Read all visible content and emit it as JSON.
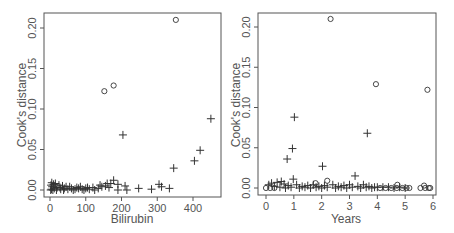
{
  "chart_data": [
    {
      "type": "scatter",
      "title": "",
      "xlabel": "Bilirubin",
      "ylabel": "Cook's distance",
      "xlim": [
        -10,
        470
      ],
      "ylim": [
        -0.008,
        0.22
      ],
      "xticks": [
        "0",
        "100",
        "200",
        "300",
        "400"
      ],
      "yticks": [
        "0.00",
        "0.05",
        "0.10",
        "0.15",
        "0.20"
      ],
      "grid": false,
      "legend": null,
      "series": [
        {
          "name": "circle-points",
          "marker": "o",
          "points": [
            [
              152,
              0.122
            ],
            [
              178,
              0.129
            ],
            [
              352,
              0.21
            ]
          ]
        },
        {
          "name": "plus-points",
          "marker": "+",
          "points": [
            [
              204,
              0.068
            ],
            [
              450,
              0.088
            ],
            [
              420,
              0.049
            ],
            [
              404,
              0.036
            ],
            [
              346,
              0.027
            ],
            [
              178,
              0.012
            ],
            [
              170,
              0.008
            ],
            [
              160,
              0.008
            ],
            [
              190,
              0.007
            ],
            [
              210,
              0.005
            ],
            [
              305,
              0.007
            ],
            [
              312,
              0.004
            ],
            [
              334,
              0.002
            ],
            [
              248,
              0.002
            ],
            [
              284,
              0.001
            ],
            [
              215,
              0.0
            ],
            [
              190,
              0.0
            ],
            [
              165,
              0.003
            ],
            [
              145,
              0.004
            ],
            [
              135,
              0.002
            ],
            [
              120,
              0.003
            ],
            [
              110,
              0.001
            ],
            [
              100,
              0.002
            ],
            [
              90,
              0.001
            ],
            [
              80,
              0.002
            ],
            [
              70,
              0.001
            ],
            [
              60,
              0.002
            ],
            [
              50,
              0.001
            ],
            [
              45,
              0.004
            ],
            [
              40,
              0.002
            ],
            [
              35,
              0.005
            ],
            [
              30,
              0.001
            ],
            [
              25,
              0.006
            ],
            [
              20,
              0.003
            ],
            [
              15,
              0.008
            ],
            [
              12,
              0.002
            ],
            [
              10,
              0.007
            ],
            [
              8,
              0.0
            ],
            [
              6,
              0.004
            ],
            [
              5,
              0.009
            ],
            [
              4,
              0.001
            ],
            [
              3,
              0.006
            ],
            [
              2,
              0.0
            ],
            [
              18,
              0.0
            ],
            [
              28,
              0.003
            ],
            [
              38,
              0.0
            ],
            [
              55,
              0.004
            ],
            [
              65,
              0.0
            ],
            [
              75,
              0.003
            ],
            [
              85,
              0.004
            ],
            [
              95,
              0.0
            ],
            [
              105,
              0.003
            ],
            [
              125,
              0.0
            ],
            [
              140,
              0.006
            ],
            [
              155,
              0.005
            ]
          ]
        }
      ]
    },
    {
      "type": "scatter",
      "title": "",
      "xlabel": "Years",
      "ylabel": "Cook's distance",
      "xlim": [
        -0.2,
        6.2
      ],
      "ylim": [
        -0.008,
        0.22
      ],
      "xticks": [
        "0",
        "1",
        "2",
        "3",
        "4",
        "5",
        "6"
      ],
      "yticks": [
        "0.00",
        "0.05",
        "0.10",
        "0.15",
        "0.20"
      ],
      "grid": false,
      "legend": null,
      "series": [
        {
          "name": "circle-points",
          "marker": "o",
          "points": [
            [
              2.32,
              0.21
            ],
            [
              3.95,
              0.129
            ],
            [
              5.8,
              0.122
            ],
            [
              2.2,
              0.009
            ],
            [
              1.78,
              0.006
            ],
            [
              4.72,
              0.004
            ],
            [
              5.68,
              0.003
            ],
            [
              0.0,
              0.0
            ],
            [
              0.15,
              0.0
            ],
            [
              0.3,
              0.0
            ],
            [
              4.1,
              0.0
            ],
            [
              4.3,
              0.0
            ],
            [
              4.5,
              0.0
            ],
            [
              4.7,
              0.0
            ],
            [
              4.9,
              0.0
            ],
            [
              5.05,
              0.0
            ],
            [
              5.15,
              0.0
            ],
            [
              5.55,
              0.0
            ],
            [
              5.72,
              0.0
            ],
            [
              5.85,
              0.0
            ],
            [
              5.9,
              0.0
            ]
          ]
        },
        {
          "name": "plus-points",
          "marker": "+",
          "points": [
            [
              1.02,
              0.088
            ],
            [
              3.64,
              0.068
            ],
            [
              0.95,
              0.049
            ],
            [
              0.76,
              0.036
            ],
            [
              2.03,
              0.027
            ],
            [
              3.2,
              0.015
            ],
            [
              0.98,
              0.011
            ],
            [
              0.55,
              0.008
            ],
            [
              0.4,
              0.007
            ],
            [
              0.2,
              0.006
            ],
            [
              0.1,
              0.004
            ],
            [
              0.65,
              0.005
            ],
            [
              0.8,
              0.003
            ],
            [
              1.1,
              0.004
            ],
            [
              1.3,
              0.002
            ],
            [
              1.5,
              0.003
            ],
            [
              1.7,
              0.004
            ],
            [
              1.9,
              0.002
            ],
            [
              2.1,
              0.003
            ],
            [
              2.4,
              0.004
            ],
            [
              2.6,
              0.002
            ],
            [
              2.8,
              0.003
            ],
            [
              3.0,
              0.004
            ],
            [
              3.3,
              0.002
            ],
            [
              3.5,
              0.004
            ],
            [
              3.7,
              0.002
            ],
            [
              3.9,
              0.001
            ],
            [
              0.3,
              0.002
            ],
            [
              0.5,
              0.001
            ],
            [
              0.7,
              0.0
            ],
            [
              0.9,
              0.001
            ],
            [
              1.2,
              0.0
            ],
            [
              1.4,
              0.001
            ],
            [
              1.6,
              0.0
            ],
            [
              1.8,
              0.001
            ],
            [
              2.0,
              0.0
            ],
            [
              2.2,
              0.001
            ],
            [
              2.5,
              0.0
            ],
            [
              2.7,
              0.001
            ],
            [
              2.9,
              0.0
            ],
            [
              3.1,
              0.001
            ],
            [
              3.4,
              0.0
            ],
            [
              3.6,
              0.001
            ],
            [
              3.8,
              0.0
            ],
            [
              4.0,
              0.001
            ],
            [
              4.2,
              0.001
            ],
            [
              4.4,
              0.001
            ],
            [
              4.6,
              0.0
            ],
            [
              4.8,
              0.001
            ],
            [
              5.0,
              0.0
            ]
          ]
        }
      ]
    }
  ],
  "panels": [
    {
      "xlabel": "Bilirubin",
      "ylabel": "Cook's distance",
      "xticks": [
        "0",
        "100",
        "200",
        "300",
        "400"
      ],
      "yticks": [
        "0.00",
        "0.05",
        "0.10",
        "0.15",
        "0.20"
      ]
    },
    {
      "xlabel": "Years",
      "ylabel": "Cook's distance",
      "xticks": [
        "0",
        "1",
        "2",
        "3",
        "4",
        "5",
        "6"
      ],
      "yticks": [
        "0.00",
        "0.05",
        "0.10",
        "0.15",
        "0.20"
      ]
    }
  ],
  "colors": {
    "frame": "#555555",
    "marker": "#333333",
    "text": "#555555"
  }
}
